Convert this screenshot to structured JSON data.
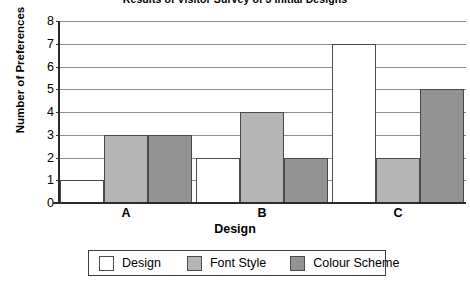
{
  "chart_data": {
    "type": "bar",
    "title": "Results of Visitor Survey of 3 Initial Designs",
    "xlabel": "Design",
    "ylabel": "Number of Preferences",
    "categories": [
      "A",
      "B",
      "C"
    ],
    "series": [
      {
        "name": "Design",
        "color": "#ffffff",
        "values": [
          1,
          2,
          7
        ]
      },
      {
        "name": "Font Style",
        "color": "#b5b5b5",
        "values": [
          3,
          4,
          2
        ]
      },
      {
        "name": "Colour Scheme",
        "color": "#939393",
        "values": [
          3,
          2,
          5
        ]
      }
    ],
    "ylim": [
      0,
      8
    ],
    "yticks": [
      0,
      1,
      2,
      3,
      4,
      5,
      6,
      7,
      8
    ],
    "ytick_labels": [
      "0",
      "1",
      "2",
      "3",
      "4",
      "5",
      "6",
      "7",
      "8"
    ],
    "grid": true,
    "legend_position": "bottom"
  }
}
